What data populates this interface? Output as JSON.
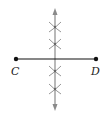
{
  "diagram": {
    "points": [
      {
        "label": "C",
        "x": 16,
        "y": 59
      },
      {
        "label": "D",
        "x": 96,
        "y": 59
      }
    ],
    "segment": {
      "from": "C",
      "to": "D",
      "color": "#111111"
    },
    "bisector": {
      "x": 55,
      "y_top": 8,
      "y_bottom": 111,
      "color": "#8a8a8a",
      "arrows": "both"
    },
    "arc_marks_y": [
      27,
      44,
      71,
      89
    ]
  }
}
